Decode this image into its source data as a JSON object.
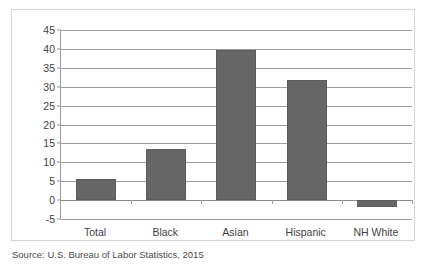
{
  "chart_data": {
    "type": "bar",
    "title": "",
    "subtitle": "",
    "xlabel": "",
    "ylabel": "",
    "categories": [
      "Total",
      "Black",
      "Asian",
      "Hispanic",
      "NH White"
    ],
    "values": [
      5.7,
      13.4,
      39.8,
      31.7,
      -1.7
    ],
    "series": [
      {
        "name": "",
        "values": [
          5.7,
          13.4,
          39.8,
          31.7,
          -1.7
        ]
      }
    ],
    "ylim": [
      -5,
      45
    ],
    "ytick_step": 5,
    "yticks": [
      45,
      40,
      35,
      30,
      25,
      20,
      15,
      10,
      5,
      0,
      -5
    ],
    "ytick_labels": [
      "45",
      "40",
      "35",
      "30",
      "25",
      "20",
      "15",
      "10",
      "5",
      "0",
      "-5"
    ],
    "grid": true,
    "grid_axis": "y",
    "legend": false,
    "legend_position": "none",
    "bar_color": "#666666",
    "gridline_color": "#9d9d9d",
    "frame_color": "#d4d4d4",
    "text_color": "#3f3f3f"
  },
  "source": {
    "text": "Source: U.S. Bureau of Labor Statistics, 2015"
  }
}
